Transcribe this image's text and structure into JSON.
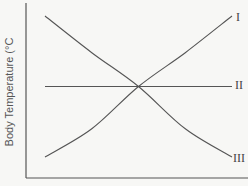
{
  "chart_data": {
    "type": "line",
    "title": "",
    "xlabel": "",
    "ylabel": "Body Temperature (°C",
    "grid": false,
    "legend": "inline labels at right end of lines",
    "x": [
      0,
      0.25,
      0.5,
      0.75,
      1
    ],
    "series": [
      {
        "name": "I",
        "trend": "increasing (concave up)",
        "values": [
          0.0,
          0.2,
          0.5,
          0.74,
          1.0
        ]
      },
      {
        "name": "II",
        "trend": "constant",
        "values": [
          0.5,
          0.5,
          0.5,
          0.5,
          0.5
        ]
      },
      {
        "name": "III",
        "trend": "decreasing (concave up)",
        "values": [
          1.0,
          0.74,
          0.5,
          0.2,
          0.0
        ]
      }
    ],
    "annotations": [
      "Lines I and III intersect line II at the midpoint"
    ]
  },
  "colors": {
    "background": "#f7f7f5",
    "axis": "#555555",
    "line": "#555555",
    "text": "#444444"
  }
}
